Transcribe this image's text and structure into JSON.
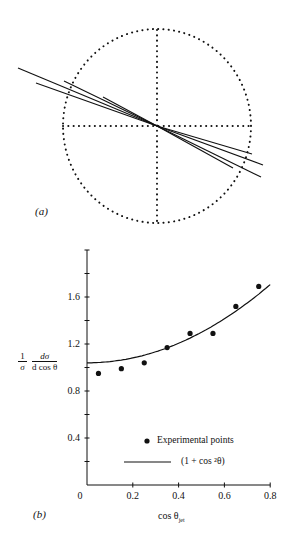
{
  "panel_a": {
    "label": "(a)",
    "description": "Two-jet event display: dotted circle with dotted cross axes and back-to-back tracks"
  },
  "panel_b": {
    "label": "(b)",
    "ylabel_frac1_num": "1",
    "ylabel_frac1_den": "σ",
    "ylabel_frac2_num": "dσ",
    "ylabel_frac2_den": "d cos θ",
    "xlabel_main": "cos θ",
    "xlabel_sub": "jet",
    "y_ticks": [
      "0.4",
      "0.8",
      "1.2",
      "1.6"
    ],
    "x_ticks": [
      "0",
      "0.2",
      "0.4",
      "0.6",
      "0.8"
    ],
    "legend": {
      "points_label": "Experimental points",
      "line_label": "(1 + cos ²θ)"
    }
  },
  "chart_data": {
    "type": "scatter",
    "title": "",
    "xlabel": "cos θ_jet",
    "ylabel": "(1/σ) dσ/d cos θ",
    "xlim": [
      0,
      0.8
    ],
    "ylim": [
      0,
      2.0
    ],
    "x_ticks": [
      0,
      0.2,
      0.4,
      0.6,
      0.8
    ],
    "y_ticks": [
      0.4,
      0.8,
      1.2,
      1.6
    ],
    "grid": false,
    "legend_position": "lower right",
    "series": [
      {
        "name": "Experimental points",
        "kind": "scatter",
        "x": [
          0.05,
          0.15,
          0.25,
          0.35,
          0.45,
          0.55,
          0.65,
          0.75
        ],
        "y": [
          0.95,
          0.99,
          1.04,
          1.17,
          1.29,
          1.29,
          1.52,
          1.69
        ]
      },
      {
        "name": "(1 + cos²θ)",
        "kind": "line",
        "formula": "1.04*(1+x^2)",
        "x": [
          0.0,
          0.1,
          0.2,
          0.3,
          0.4,
          0.5,
          0.6,
          0.7,
          0.8
        ],
        "y": [
          1.04,
          1.05,
          1.08,
          1.13,
          1.21,
          1.3,
          1.41,
          1.55,
          1.67
        ]
      }
    ]
  }
}
